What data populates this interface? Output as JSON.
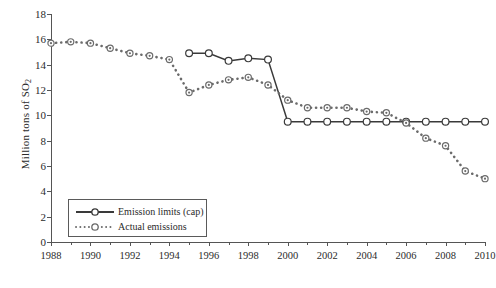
{
  "chart_data": {
    "type": "line",
    "title": "",
    "xlabel": "",
    "ylabel": "Million tons of SO2",
    "ylabel_text": "Million tons of SO",
    "ylabel_sub": "2",
    "xlim": [
      1988,
      2010
    ],
    "ylim": [
      0,
      18
    ],
    "yticks": [
      0,
      2,
      4,
      6,
      8,
      10,
      12,
      14,
      16,
      18
    ],
    "xticks": [
      1988,
      1990,
      1992,
      1994,
      1996,
      1998,
      2000,
      2002,
      2004,
      2006,
      2008,
      2010
    ],
    "grid": false,
    "legend_position": "lower-left",
    "x": [
      1988,
      1989,
      1990,
      1991,
      1992,
      1993,
      1994,
      1995,
      1996,
      1997,
      1998,
      1999,
      2000,
      2001,
      2002,
      2003,
      2004,
      2005,
      2006,
      2007,
      2008,
      2009,
      2010
    ],
    "series": [
      {
        "name": "Emission limits (cap)",
        "style": "solid",
        "color": "#3a3a3a",
        "x": [
          1995,
          1996,
          1997,
          1998,
          1999,
          2000,
          2001,
          2002,
          2003,
          2004,
          2005,
          2006,
          2007,
          2008,
          2009,
          2010
        ],
        "values": [
          14.9,
          14.9,
          14.3,
          14.5,
          14.4,
          9.5,
          9.5,
          9.5,
          9.5,
          9.5,
          9.5,
          9.5,
          9.5,
          9.5,
          9.5,
          9.5
        ]
      },
      {
        "name": "Actual emissions",
        "style": "dotted",
        "color": "#6b6b6b",
        "x": [
          1988,
          1989,
          1990,
          1991,
          1992,
          1993,
          1994,
          1995,
          1996,
          1997,
          1998,
          1999,
          2000,
          2001,
          2002,
          2003,
          2004,
          2005,
          2006,
          2007,
          2008,
          2009,
          2010
        ],
        "values": [
          15.7,
          15.8,
          15.7,
          15.3,
          14.9,
          14.7,
          14.4,
          11.8,
          12.4,
          12.8,
          13.0,
          12.4,
          11.2,
          10.6,
          10.6,
          10.6,
          10.3,
          10.2,
          9.4,
          8.2,
          7.6,
          5.6,
          5.0
        ]
      }
    ]
  },
  "legend": {
    "items": [
      {
        "label": "Emission limits (cap)"
      },
      {
        "label": "Actual emissions"
      }
    ]
  }
}
